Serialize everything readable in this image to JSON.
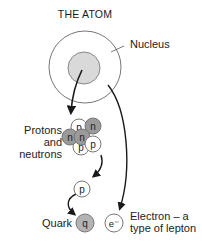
{
  "title": "THE ATOM",
  "labels": {
    "nucleus": "Nucleus",
    "protons_line1": "Protons",
    "protons_line2": "and",
    "protons_line3": "neutrons",
    "quark": "Quark",
    "electron_line1": "Electron – a",
    "electron_line2": "type of lepton"
  },
  "particles": {
    "proton": "p",
    "neutron": "n",
    "quark": "q",
    "electron": "e⁻"
  },
  "colors": {
    "shaded": "#9a9a9a",
    "nucleus_fill": "#d9d9d9",
    "line": "#1a1a1a",
    "outline": "#777777"
  }
}
